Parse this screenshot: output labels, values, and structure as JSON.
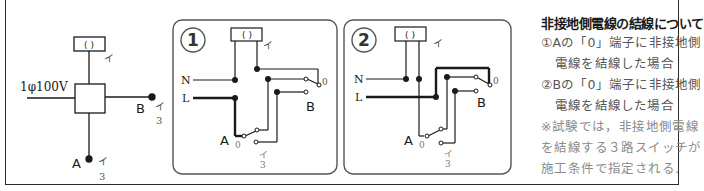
{
  "colors": {
    "line": "#1a1a1a",
    "panel_border": "#555555",
    "label_gray": "#777777",
    "note_text": "#555555",
    "note_remark": "#8a8a8a"
  },
  "overview": {
    "supply_label": "1φ100V",
    "lamp_symbol": "( )",
    "lamp_label": "イ",
    "switch_a": {
      "name": "A",
      "label": "イ",
      "type": "3"
    },
    "switch_b": {
      "name": "B",
      "label": "イ",
      "type": "3"
    }
  },
  "panel1": {
    "number": "1",
    "lamp_symbol": "( )",
    "lamp_label": "イ",
    "neutral_label": "N",
    "line_label": "L",
    "switch_a": {
      "name": "A",
      "terminal_0": "0",
      "label": "イ",
      "type": "3"
    },
    "switch_b": {
      "name": "B",
      "terminal_0": "0"
    }
  },
  "panel2": {
    "number": "2",
    "lamp_symbol": "( )",
    "lamp_label": "イ",
    "neutral_label": "N",
    "line_label": "L",
    "switch_a": {
      "name": "A",
      "terminal_0": "0",
      "label": "イ",
      "type": "3"
    },
    "switch_b": {
      "name": "B",
      "terminal_0": "0"
    }
  },
  "notes": {
    "title": "非接地側電線の結線について",
    "items": [
      {
        "marker": "①",
        "line1": "Aの「0」端子に非接地側",
        "line2": "電線を結線した場合"
      },
      {
        "marker": "②",
        "line1": "Bの「0」端子に非接地側",
        "line2": "電線を結線した場合"
      }
    ],
    "remark": [
      "※試験では，非接地側電線",
      "を結線する３路スイッチが",
      "施工条件で指定される."
    ]
  }
}
